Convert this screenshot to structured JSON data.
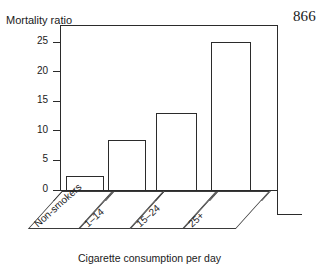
{
  "page": {
    "number": "866"
  },
  "chart_data": {
    "type": "bar",
    "title": "",
    "ylabel": "Mortality ratio",
    "xlabel": "Cigarette consumption per day",
    "categories": [
      "Non-smokers",
      "1–14",
      "15–24",
      "25+"
    ],
    "values": [
      2.4,
      8.5,
      13.0,
      25.0
    ],
    "ylim": [
      0,
      26
    ],
    "yticks": [
      0,
      5,
      10,
      15,
      20,
      25
    ],
    "ytick_labels": [
      "0",
      "5",
      "10",
      "15",
      "20",
      "25"
    ],
    "grid": false,
    "legend": null,
    "style": {
      "bar_fill": "#ffffff",
      "bar_stroke": "#2b2b2b",
      "axis_color": "#2b2b2b",
      "background": "#ffffff",
      "text_color": "#1a1a1a"
    }
  }
}
